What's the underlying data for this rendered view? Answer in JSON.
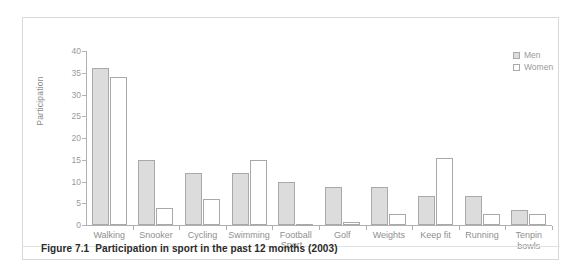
{
  "figure": {
    "caption_number": "Figure 7.1",
    "caption_text": "Participation in sport in the past 12 months (2003)"
  },
  "legend": {
    "position": "top-right",
    "entries": [
      {
        "label": "Men",
        "color": "#dcdcdc"
      },
      {
        "label": "Women",
        "color": "#ffffff"
      }
    ]
  },
  "chart_data": {
    "type": "bar",
    "title": "",
    "subtitle": "",
    "xlabel": "Sport",
    "ylabel": "Participation",
    "ylim": [
      0,
      40
    ],
    "yticks": [
      0,
      5,
      10,
      15,
      20,
      25,
      30,
      35,
      40
    ],
    "ytick_labels": [
      "0",
      "5",
      "10",
      "15",
      "20",
      "25",
      "30",
      "35",
      "40"
    ],
    "grid": false,
    "legend_position": "top-right",
    "categories": [
      "Walking",
      "Snooker",
      "Cycling",
      "Swimming",
      "Football",
      "Golf",
      "Weights",
      "Keep fit",
      "Running",
      "Tenpin bowls"
    ],
    "series": [
      {
        "name": "Men",
        "color": "#dcdcdc",
        "values": [
          36,
          15,
          12,
          12,
          10,
          8.8,
          8.8,
          6.6,
          6.6,
          3.5
        ]
      },
      {
        "name": "Women",
        "color": "#ffffff",
        "values": [
          34,
          4,
          5.9,
          15,
          0.2,
          0.6,
          2.6,
          15.5,
          2.5,
          2.5
        ]
      }
    ]
  }
}
